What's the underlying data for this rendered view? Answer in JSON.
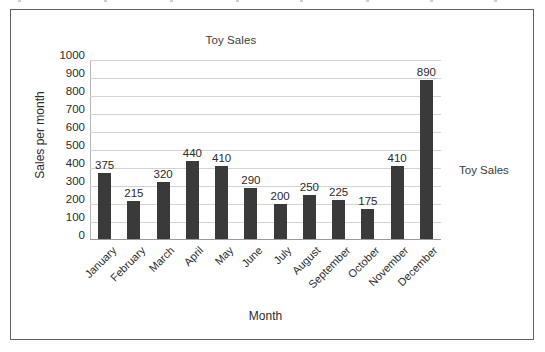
{
  "figure": {
    "border_color": "#5d6063",
    "background": "#ffffff"
  },
  "chart_data": {
    "type": "bar",
    "title": "Toy Sales",
    "xlabel": "Month",
    "ylabel": "Sales per month",
    "categories": [
      "January",
      "February",
      "March",
      "April",
      "May",
      "June",
      "July",
      "August",
      "September",
      "October",
      "November",
      "December"
    ],
    "values": [
      375,
      215,
      320,
      440,
      410,
      290,
      200,
      250,
      225,
      175,
      410,
      890
    ],
    "data_labels": [
      "375",
      "215",
      "320",
      "440",
      "410",
      "290",
      "200",
      "250",
      "225",
      "175",
      "410",
      "890"
    ],
    "ylim": [
      0,
      1000
    ],
    "ytick_labels": [
      "1000",
      "900",
      "800",
      "700",
      "600",
      "500",
      "400",
      "300",
      "200",
      "100",
      "0"
    ],
    "ytick_values": [
      1000,
      900,
      800,
      700,
      600,
      500,
      400,
      300,
      200,
      100,
      0
    ],
    "grid": true,
    "grid_axis": "y",
    "grid_color": "#d3d3d3",
    "series": [
      {
        "name": "Toy Sales",
        "color": "#3a3a3a",
        "values": [
          375,
          215,
          320,
          440,
          410,
          290,
          200,
          250,
          225,
          175,
          410,
          890
        ]
      }
    ],
    "legend": {
      "position": "right",
      "entries": [
        "Toy Sales"
      ]
    },
    "xtick_rotation": -45,
    "bar_color": "#3a3a3a"
  },
  "legend": {
    "label": "Toy Sales"
  }
}
